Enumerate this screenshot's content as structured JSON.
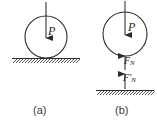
{
  "figure": {
    "type": "physics-free-body-diagram",
    "panels": [
      {
        "id": "a",
        "caption": "(a)",
        "body": {
          "shape": "circle",
          "cx": 46,
          "cy": 37,
          "r": 21
        },
        "ground": {
          "type": "hatched-line",
          "x1": 12,
          "x2": 80,
          "y": 58
        },
        "forces": [
          {
            "name": "P",
            "label": "P",
            "direction": "down",
            "applied_at": "top-of-circle"
          }
        ]
      },
      {
        "id": "b",
        "caption": "(b)",
        "body": {
          "shape": "circle",
          "cx": 125,
          "cy": 34,
          "r": 22
        },
        "ground": {
          "type": "hatched-line",
          "x1": 96,
          "x2": 154,
          "y": 90
        },
        "forces": [
          {
            "name": "P",
            "label": "P",
            "direction": "down",
            "applied_at": "top-of-circle"
          },
          {
            "name": "F_N",
            "label": "F",
            "subscript": "N",
            "prime": false,
            "direction": "up",
            "applied_at": "bottom-of-circle"
          },
          {
            "name": "F'_N",
            "label": "F",
            "subscript": "N",
            "prime": true,
            "direction": "up",
            "applied_at": "ground-surface"
          }
        ]
      }
    ],
    "colors": {
      "stroke": "#2b2b2b",
      "hatch": "#3a3a3a",
      "text": "#222222",
      "caption": "#3a3a3a",
      "background": "#ffffff"
    }
  },
  "labels": {
    "caption_a": "(a)",
    "caption_b": "(b)",
    "force_p_a": "P",
    "force_p_b": "P",
    "force_fn_base": "F",
    "force_fn_sub": "N",
    "force_fnp_base": "F",
    "force_fnp_prime": "'",
    "force_fnp_sub": "N"
  }
}
